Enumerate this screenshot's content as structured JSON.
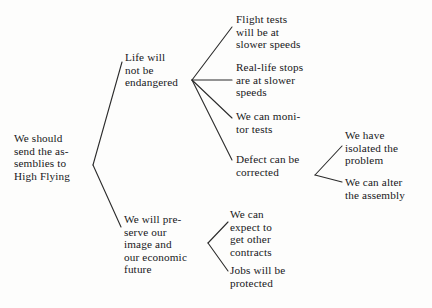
{
  "diagram": {
    "type": "argument-tree",
    "title_visible": false,
    "background_color": "#fdfdfc",
    "line_color": "#2b2b2b",
    "text_color": "#17171a",
    "nodes": [
      {
        "id": "root",
        "name": "claim-root",
        "text": "We should\nsend the as-\nsemblies to\nHigh Flying",
        "x": 14,
        "y": 132,
        "level": 0
      },
      {
        "id": "life",
        "name": "reason-life-not-endangered",
        "text": "Life will\nnot be\nendangered",
        "x": 125,
        "y": 51,
        "level": 1
      },
      {
        "id": "image",
        "name": "reason-preserve-image",
        "text": "We will pre-\nserve our\nimage and\nour economic\nfuture",
        "x": 124,
        "y": 213,
        "level": 1
      },
      {
        "id": "flight",
        "name": "support-flight-tests",
        "text": "Flight tests\nwill be at\nslower speeds",
        "x": 236,
        "y": 13,
        "level": 2
      },
      {
        "id": "reallife",
        "name": "support-real-life-stops",
        "text": "Real-life stops\nare at slower\nspeeds",
        "x": 236,
        "y": 61,
        "level": 2
      },
      {
        "id": "monitor",
        "name": "support-monitor-tests",
        "text": "We can moni-\ntor tests",
        "x": 236,
        "y": 110,
        "level": 2
      },
      {
        "id": "defect",
        "name": "support-defect-corrected",
        "text": "Defect can be\ncorrected",
        "x": 236,
        "y": 153,
        "level": 2
      },
      {
        "id": "contracts",
        "name": "support-other-contracts",
        "text": "We can\nexpect to\nget other\ncontracts",
        "x": 230,
        "y": 208,
        "level": 2
      },
      {
        "id": "jobs",
        "name": "support-jobs-protected",
        "text": "Jobs will be\nprotected",
        "x": 230,
        "y": 264,
        "level": 2
      },
      {
        "id": "isolated",
        "name": "support-isolated-problem",
        "text": "We have\nisolated the\nproblem",
        "x": 345,
        "y": 129,
        "level": 3
      },
      {
        "id": "alter",
        "name": "support-alter-assembly",
        "text": "We can alter\nthe assembly",
        "x": 345,
        "y": 176,
        "level": 3
      }
    ],
    "edges": [
      {
        "name": "edge-root-to-life",
        "x1": 93,
        "y1": 165,
        "x2": 122,
        "y2": 62
      },
      {
        "name": "edge-root-to-image",
        "x1": 93,
        "y1": 165,
        "x2": 121,
        "y2": 227
      },
      {
        "name": "edge-life-to-flight",
        "x1": 192,
        "y1": 80,
        "x2": 232,
        "y2": 27
      },
      {
        "name": "edge-life-to-reallife",
        "x1": 192,
        "y1": 80,
        "x2": 232,
        "y2": 80
      },
      {
        "name": "edge-life-to-monitor",
        "x1": 192,
        "y1": 80,
        "x2": 232,
        "y2": 118
      },
      {
        "name": "edge-life-to-defect",
        "x1": 192,
        "y1": 80,
        "x2": 232,
        "y2": 160
      },
      {
        "name": "edge-defect-to-isolated",
        "x1": 315,
        "y1": 175,
        "x2": 342,
        "y2": 146
      },
      {
        "name": "edge-defect-to-alter",
        "x1": 315,
        "y1": 175,
        "x2": 342,
        "y2": 182
      },
      {
        "name": "edge-image-to-contracts",
        "x1": 208,
        "y1": 243,
        "x2": 228,
        "y2": 222
      },
      {
        "name": "edge-image-to-jobs",
        "x1": 208,
        "y1": 243,
        "x2": 228,
        "y2": 271
      }
    ]
  }
}
